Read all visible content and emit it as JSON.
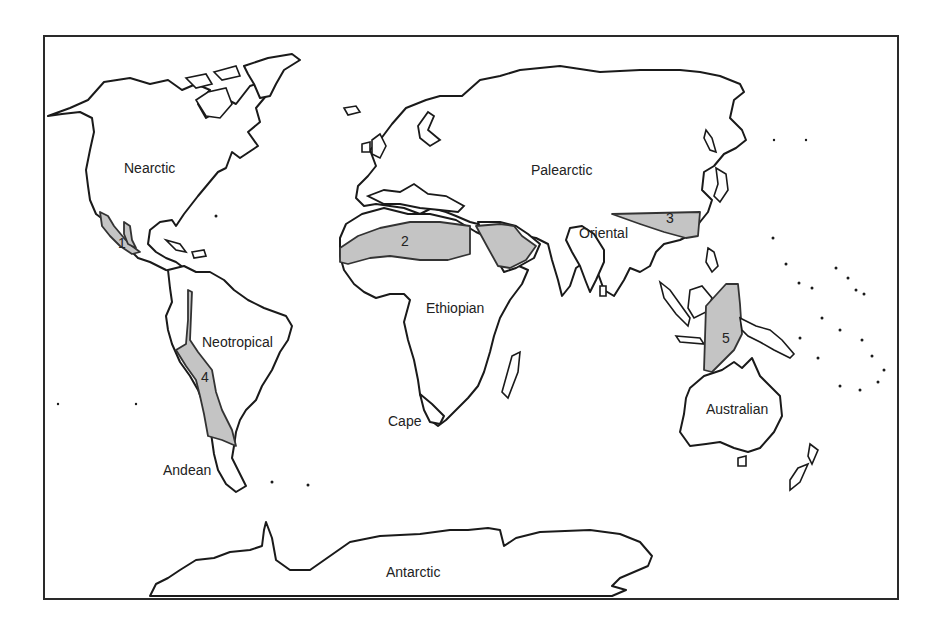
{
  "map": {
    "title": "",
    "regions": [
      {
        "id": "nearctic",
        "label": "Nearctic",
        "x": 124,
        "y": 161
      },
      {
        "id": "palearctic",
        "label": "Palearctic",
        "x": 531,
        "y": 163
      },
      {
        "id": "oriental",
        "label": "Oriental",
        "x": 579,
        "y": 226
      },
      {
        "id": "ethiopian",
        "label": "Ethiopian",
        "x": 426,
        "y": 301
      },
      {
        "id": "neotropical",
        "label": "Neotropical",
        "x": 202,
        "y": 335
      },
      {
        "id": "australian",
        "label": "Australian",
        "x": 706,
        "y": 402
      },
      {
        "id": "cape",
        "label": "Cape",
        "x": 388,
        "y": 414
      },
      {
        "id": "andean",
        "label": "Andean",
        "x": 163,
        "y": 463
      },
      {
        "id": "antarctic",
        "label": "Antarctic",
        "x": 386,
        "y": 565
      }
    ],
    "transition_zones": [
      {
        "id": "zone-1",
        "number": "1",
        "x": 118,
        "y": 236,
        "description": "Mexican transition zone"
      },
      {
        "id": "zone-2",
        "number": "2",
        "x": 401,
        "y": 234,
        "description": "Saharo-Arabian transition zone"
      },
      {
        "id": "zone-3",
        "number": "3",
        "x": 666,
        "y": 211,
        "description": "Chinese transition zone"
      },
      {
        "id": "zone-4",
        "number": "4",
        "x": 201,
        "y": 370,
        "description": "South American transition zone"
      },
      {
        "id": "zone-5",
        "number": "5",
        "x": 722,
        "y": 331,
        "description": "Wallacea"
      }
    ],
    "colors": {
      "frame": "#2a2a2a",
      "coastline": "#1a1a1a",
      "transition_fill": "#c4c4c4",
      "background": "#ffffff"
    }
  }
}
